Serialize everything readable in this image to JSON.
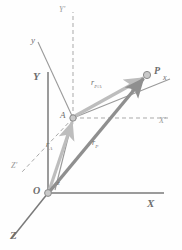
{
  "figure": {
    "name": "relative-position-vector-diagram",
    "background_color": "#fefefe"
  },
  "colors": {
    "fixed_axis": "#7a7a7a",
    "dashed_axis": "#a9a9a9",
    "primary_vector": "#8f8f8f",
    "highlight_vector": "#bdbdbd",
    "label_text": "#6d6d6d",
    "point_fill": "#c9c9c9",
    "point_stroke": "#8a8a8a"
  },
  "points": [
    {
      "id": "O",
      "label": "O",
      "x": 48,
      "y": 193,
      "label_x": 33,
      "label_y": 186,
      "bold": true
    },
    {
      "id": "A",
      "label": "A",
      "x": 73,
      "y": 118,
      "label_x": 60,
      "label_y": 111,
      "bold": false
    },
    {
      "id": "P",
      "label": "P",
      "x": 147,
      "y": 75,
      "label_x": 154,
      "label_y": 66,
      "bold": true
    }
  ],
  "axes": [
    {
      "id": "Y",
      "label": "Y",
      "style": "solid",
      "label_x": 33,
      "label_y": 71
    },
    {
      "id": "X",
      "label": "X",
      "style": "solid",
      "label_x": 147,
      "label_y": 198
    },
    {
      "id": "Z",
      "label": "Z",
      "style": "solid",
      "label_x": 10,
      "label_y": 230
    },
    {
      "id": "Y-prime",
      "label": "Y'",
      "style": "dashed",
      "label_x": 59,
      "label_y": 6
    },
    {
      "id": "X-prime",
      "label": "X'",
      "style": "dashed",
      "label_x": 159,
      "label_y": 117
    },
    {
      "id": "Z-prime",
      "label": "Z'",
      "style": "dashed",
      "label_x": 11,
      "label_y": 162
    },
    {
      "id": "y",
      "label": "y",
      "style": "solid",
      "label_x": 31,
      "label_y": 36
    },
    {
      "id": "x",
      "label": "x",
      "style": "solid",
      "label_x": 163,
      "label_y": 74
    },
    {
      "id": "z",
      "label": "z",
      "style": "solid",
      "label_x": 57,
      "label_y": 180
    }
  ],
  "vectors": [
    {
      "id": "r-A",
      "label_base": "r",
      "label_sub": "A",
      "from": "O",
      "to": "A",
      "label_x": 46,
      "label_y": 141,
      "color": "#bdbdbd"
    },
    {
      "id": "r-P",
      "label_base": "r",
      "label_sub": "P",
      "from": "O",
      "to": "P",
      "label_x": 92,
      "label_y": 139,
      "color": "#8f8f8f"
    },
    {
      "id": "r-P-over-A",
      "label_base": "r",
      "label_sub": "P/A",
      "from": "A",
      "to": "P",
      "label_x": 91,
      "label_y": 79,
      "color": "#bdbdbd"
    }
  ]
}
